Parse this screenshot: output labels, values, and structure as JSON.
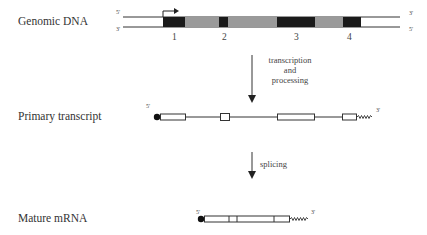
{
  "rows": {
    "genomic": {
      "label": "Genomic DNA",
      "top_5": "5'",
      "top_3": "3'",
      "bot_3": "3'",
      "bot_5": "5'"
    },
    "primary": {
      "label": "Primary transcript",
      "end_5": "5'",
      "end_3": "3'"
    },
    "mature": {
      "label": "Mature mRNA",
      "end_5": "5'",
      "end_3": "3'"
    }
  },
  "exon_numbers": [
    "1",
    "2",
    "3",
    "4"
  ],
  "steps": {
    "step1": {
      "line1": "transcription",
      "line2": "and",
      "line3": "processing"
    },
    "step2": {
      "label": "splicing"
    }
  },
  "colors": {
    "exon": "#1a1a1a",
    "intron": "#9a9a9a",
    "line": "#333333"
  }
}
